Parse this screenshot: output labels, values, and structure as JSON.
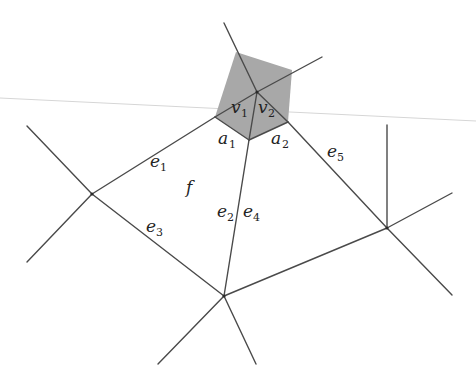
{
  "figure": {
    "type": "planar graph face diagram",
    "shaded_region_color": "#a8a8a8",
    "line_color": "#4a4a4a",
    "labels": {
      "v1": {
        "base": "v",
        "sub": "1"
      },
      "v2": {
        "base": "v",
        "sub": "2"
      },
      "a1": {
        "base": "a",
        "sub": "1"
      },
      "a2": {
        "base": "a",
        "sub": "2"
      },
      "e1": {
        "base": "e",
        "sub": "1"
      },
      "e2": {
        "base": "e",
        "sub": "2"
      },
      "e3": {
        "base": "e",
        "sub": "3"
      },
      "e4": {
        "base": "e",
        "sub": "4"
      },
      "e5": {
        "base": "e",
        "sub": "5"
      },
      "f": {
        "base": "f"
      }
    }
  }
}
